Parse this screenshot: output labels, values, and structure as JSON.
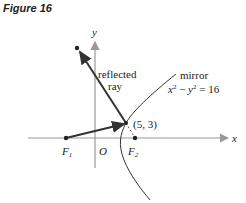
{
  "figure": {
    "title": "Figure 16",
    "axes": {
      "x_label": "x",
      "y_label": "y",
      "origin_label": "O"
    },
    "labels": {
      "reflected_line1": "reflected",
      "reflected_line2": "ray",
      "mirror": "mirror",
      "equation_x": "x",
      "equation_y": "y",
      "equation_rest": " = 16",
      "equation_minus": " − ",
      "exp": "2",
      "point": "(5, 3)",
      "focus1": "F",
      "focus1_sub": "1",
      "focus2": "F",
      "focus2_sub": "2"
    },
    "colors": {
      "axis": "#9a9a9a",
      "ray": "#333333",
      "curve": "#333333"
    }
  }
}
